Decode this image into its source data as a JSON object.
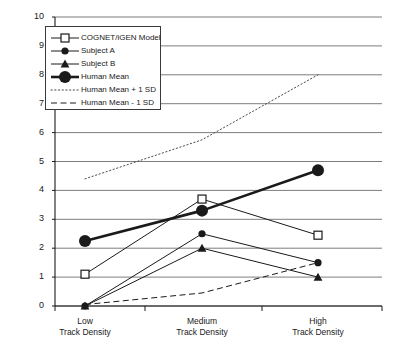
{
  "chart_data": {
    "type": "line",
    "title": "",
    "subtitle": "",
    "xlabel": "",
    "ylabel": "",
    "ylim": [
      0,
      10
    ],
    "yticks": [
      0,
      1,
      2,
      3,
      4,
      5,
      6,
      7,
      8,
      9,
      10
    ],
    "ytick_labels": [
      "0",
      "1",
      "2",
      "3",
      "4",
      "5",
      "6",
      "7",
      "8",
      "9",
      "10"
    ],
    "grid": true,
    "grid_axis": "y",
    "legend_position": "upper-left-inset",
    "categories": [
      "Low Track Density",
      "Medium Track Density",
      "High Track Density"
    ],
    "category_lines": [
      [
        "Low",
        "Track Density"
      ],
      [
        "Medium",
        "Track Density"
      ],
      [
        "High",
        "Track Density"
      ]
    ],
    "series": [
      {
        "name": "COGNET/iGEN Model",
        "values": [
          1.1,
          3.7,
          2.45
        ],
        "marker": "open-square",
        "linestyle": "solid",
        "linewidth": 1,
        "color": "#1a1a1a"
      },
      {
        "name": "Subject A",
        "values": [
          0.0,
          2.5,
          1.5
        ],
        "marker": "filled-circle-small",
        "linestyle": "solid",
        "linewidth": 1,
        "color": "#1a1a1a"
      },
      {
        "name": "Subject B",
        "values": [
          0.0,
          2.0,
          1.0
        ],
        "marker": "filled-triangle",
        "linestyle": "solid",
        "linewidth": 1,
        "color": "#1a1a1a"
      },
      {
        "name": "Human Mean",
        "values": [
          2.25,
          3.3,
          4.7
        ],
        "marker": "filled-circle-large",
        "linestyle": "solid",
        "linewidth": 2.6,
        "color": "#1a1a1a"
      },
      {
        "name": "Human Mean + 1 SD",
        "values": [
          4.4,
          5.75,
          8.0
        ],
        "marker": "none",
        "linestyle": "dotted",
        "linewidth": 1,
        "color": "#4a4a4a"
      },
      {
        "name": "Human Mean - 1 SD",
        "values": [
          0.05,
          0.45,
          1.5
        ],
        "marker": "none",
        "linestyle": "dashed",
        "linewidth": 1,
        "color": "#1a1a1a"
      }
    ]
  },
  "legend": {
    "entries": [
      {
        "label": "COGNET/iGEN Model"
      },
      {
        "label": "Subject A"
      },
      {
        "label": "Subject B"
      },
      {
        "label": "Human Mean"
      },
      {
        "label": "Human Mean + 1 SD"
      },
      {
        "label": "Human Mean - 1 SD"
      }
    ]
  },
  "colors": {
    "ink": "#1a1a1a",
    "grid": "#6e6e6e",
    "background": "#ffffff"
  }
}
